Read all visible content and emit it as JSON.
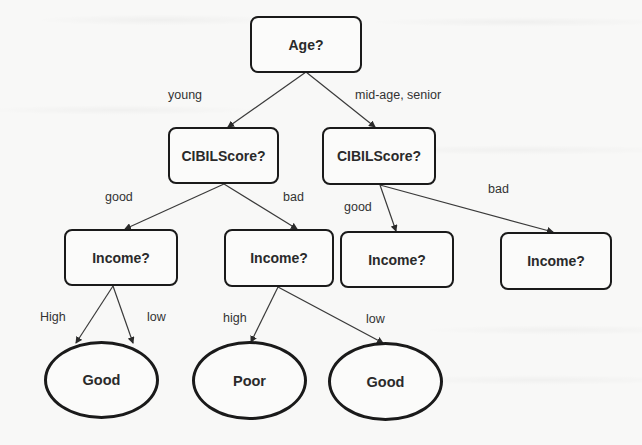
{
  "diagram": {
    "type": "decision-tree",
    "nodes": {
      "root": {
        "label": "Age?",
        "shape": "rounded-rect"
      },
      "cibil_young": {
        "label": "CIBILScore?",
        "shape": "rounded-rect"
      },
      "cibil_older": {
        "label": "CIBILScore?",
        "shape": "rounded-rect"
      },
      "income_young_good": {
        "label": "Income?",
        "shape": "rounded-rect"
      },
      "income_young_bad": {
        "label": "Income?",
        "shape": "rounded-rect"
      },
      "income_older_good": {
        "label": "Income?",
        "shape": "rounded-rect"
      },
      "income_older_bad": {
        "label": "Income?",
        "shape": "rounded-rect"
      },
      "leaf_good_1": {
        "label": "Good",
        "shape": "ellipse"
      },
      "leaf_poor": {
        "label": "Poor",
        "shape": "ellipse"
      },
      "leaf_good_2": {
        "label": "Good",
        "shape": "ellipse"
      }
    },
    "edges": [
      {
        "from": "root",
        "to": "cibil_young",
        "label": "young"
      },
      {
        "from": "root",
        "to": "cibil_older",
        "label": "mid-age, senior"
      },
      {
        "from": "cibil_young",
        "to": "income_young_good",
        "label": "good"
      },
      {
        "from": "cibil_young",
        "to": "income_young_bad",
        "label": "bad"
      },
      {
        "from": "cibil_older",
        "to": "income_older_good",
        "label": "good"
      },
      {
        "from": "cibil_older",
        "to": "income_older_bad",
        "label": "bad"
      },
      {
        "from": "income_young_good",
        "to": "leaf_good_1",
        "label": "High"
      },
      {
        "from": "income_young_good",
        "to": "leaf_good_1",
        "label": "low"
      },
      {
        "from": "income_young_bad",
        "to": "leaf_poor",
        "label": "high"
      },
      {
        "from": "income_young_bad",
        "to": "leaf_good_2",
        "label": "low"
      }
    ],
    "colors": {
      "stroke": "#1a1a1a",
      "text": "#2a2a2a",
      "edge": "#3a3a3a",
      "background": "#f8f8f7"
    }
  }
}
